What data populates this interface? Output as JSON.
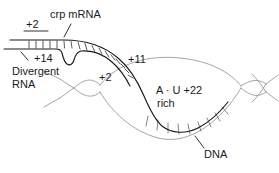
{
  "figure": {
    "name": "crp-mrna-dna-hybrid-diagram",
    "background_color": "#ffffff",
    "rna_color": "#1a1a1a",
    "dna_color": "#9a9a9a",
    "text_color": "#1a1a1a"
  },
  "labels": {
    "crp_mrna": "crp mRNA",
    "plus2_top": "+2",
    "plus14": "+14",
    "divergent": "Divergent",
    "rna": "RNA",
    "plus2_mid": "+2",
    "plus11": "+11",
    "au_rich_top": "A · U  +22",
    "au_rich_bottom": "rich",
    "dna": "DNA"
  },
  "elements": {
    "rna_duplex": "rna-duplex-strands",
    "rna_bulge": "rna-hairpin-bulge",
    "dna_helix": "dna-double-helix",
    "dna_bubble": "dna-open-bubble",
    "basepair_ticks": "base-pair-tick-marks",
    "leader_crp": "crp-mrna-leader-line",
    "leader_plus14": "plus14-leader-line",
    "leader_dna": "dna-leader-line"
  }
}
